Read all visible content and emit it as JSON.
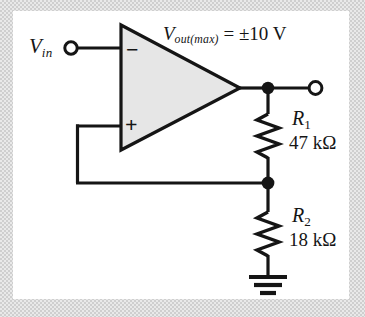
{
  "figure": {
    "kind": "op-amp-comparator-schematic",
    "panel_background": "#ffffff",
    "line_color": "#151515",
    "opamp_fill": "#e6e6e6"
  },
  "labels": {
    "input_source": {
      "symbol": "V",
      "subscript": "in"
    },
    "output_spec": {
      "symbol": "V",
      "subscript": "out(max)",
      "equals": " = ",
      "value": "±10 V",
      "full_text": "Vout(max) = ±10 V"
    },
    "opamp": {
      "inverting_input": "−",
      "noninverting_input": "+"
    },
    "r1": {
      "ref": "R",
      "index": "1",
      "value": "47 kΩ"
    },
    "r2": {
      "ref": "R",
      "index": "2",
      "value": "18 kΩ"
    }
  },
  "nodes": {
    "input_terminal": "open-circle-terminal",
    "output_terminal": "open-circle-terminal",
    "output_junction": "filled-junction-dot",
    "feedback_junction": "filled-junction-dot",
    "ground": "ground-symbol"
  }
}
